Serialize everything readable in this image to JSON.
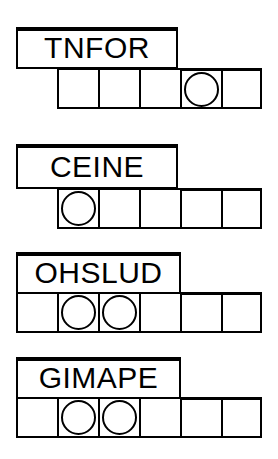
{
  "page": {
    "background_color": "#ffffff",
    "ink_color": "#000000"
  },
  "puzzle": {
    "type": "word-scramble",
    "row_count": 4,
    "rows": [
      {
        "id": "row-1",
        "scrambled_word": "TNFOR",
        "letter_count": 5,
        "word_box": {
          "x": 16,
          "y": 27,
          "width": 162,
          "height": 41
        },
        "cell_strip": {
          "x": 57,
          "y": 68,
          "cell_count": 5,
          "cell_size": 41
        },
        "circled_cells": [
          4
        ],
        "cells": [
          "",
          "",
          "",
          "",
          ""
        ]
      },
      {
        "id": "row-2",
        "scrambled_word": "CEINE",
        "letter_count": 5,
        "word_box": {
          "x": 16,
          "y": 144,
          "width": 162,
          "height": 44
        },
        "cell_strip": {
          "x": 57,
          "y": 188,
          "cell_count": 5,
          "cell_size": 41
        },
        "circled_cells": [
          1
        ],
        "cells": [
          "",
          "",
          "",
          "",
          ""
        ]
      },
      {
        "id": "row-3",
        "scrambled_word": "OHSLUD",
        "letter_count": 6,
        "word_box": {
          "x": 16,
          "y": 252,
          "width": 165,
          "height": 41
        },
        "cell_strip": {
          "x": 16,
          "y": 292,
          "cell_count": 6,
          "cell_size": 41
        },
        "circled_cells": [
          2,
          3
        ],
        "cells": [
          "",
          "",
          "",
          "",
          "",
          ""
        ]
      },
      {
        "id": "row-4",
        "scrambled_word": "GIMAPE",
        "letter_count": 6,
        "word_box": {
          "x": 16,
          "y": 357,
          "width": 165,
          "height": 41
        },
        "cell_strip": {
          "x": 16,
          "y": 397,
          "cell_count": 6,
          "cell_size": 41
        },
        "circled_cells": [
          2,
          3
        ],
        "cells": [
          "",
          "",
          "",
          "",
          "",
          ""
        ]
      }
    ]
  }
}
